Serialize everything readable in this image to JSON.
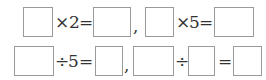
{
  "row1": {
    "eq1": {
      "operator": "×",
      "operand": "2",
      "equals": "="
    },
    "separator": ",",
    "eq2": {
      "operator": "×",
      "operand": "5",
      "equals": "="
    }
  },
  "row2": {
    "eq1": {
      "operator": "÷",
      "operand": "5",
      "equals": "="
    },
    "separator": ",",
    "eq2": {
      "operator": "÷",
      "equals": "="
    }
  }
}
